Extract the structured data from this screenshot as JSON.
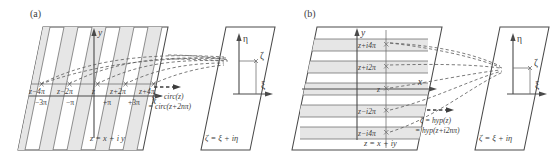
{
  "figure": {
    "caption_panels": [
      "(a)",
      "(b)"
    ],
    "background_color": "#ffffff",
    "line_color": "#4a4a4a",
    "band_color": "#e6e6e6",
    "text_color": "#3d3d3d"
  },
  "panel_a": {
    "tag": "(a)",
    "source_plane": {
      "axis_x_label": "x",
      "axis_y_label": "y",
      "plane_label": "z = x + i y",
      "strip_labels": [
        "z−4π",
        "z−2π",
        "z",
        "z+2π",
        "z+4π"
      ],
      "tick_labels": [
        "−3π",
        "−π",
        "+π",
        "+3π"
      ]
    },
    "mapping": {
      "line1": "ζ = circ(z)",
      "line2": "= circ(z+2nπ)"
    },
    "target_plane": {
      "axis_xi_label": "ξ",
      "axis_eta_label": "η",
      "point_label": "ζ",
      "plane_label": "ζ = ξ + iη"
    }
  },
  "panel_b": {
    "tag": "(b)",
    "source_plane": {
      "axis_x_label": "x",
      "axis_y_label": "y",
      "plane_label": "z = x + iy",
      "strip_labels": [
        "z+i4π",
        "z+i2π",
        "z",
        "z−i2π",
        "z−i4π"
      ]
    },
    "mapping": {
      "line1": "ζ = hyp(z)",
      "line2": "= hyp(z+i2nπ)"
    },
    "target_plane": {
      "axis_xi_label": "ξ",
      "axis_eta_label": "η",
      "point_label": "ζ",
      "plane_label": "ζ = ξ + iη"
    }
  }
}
